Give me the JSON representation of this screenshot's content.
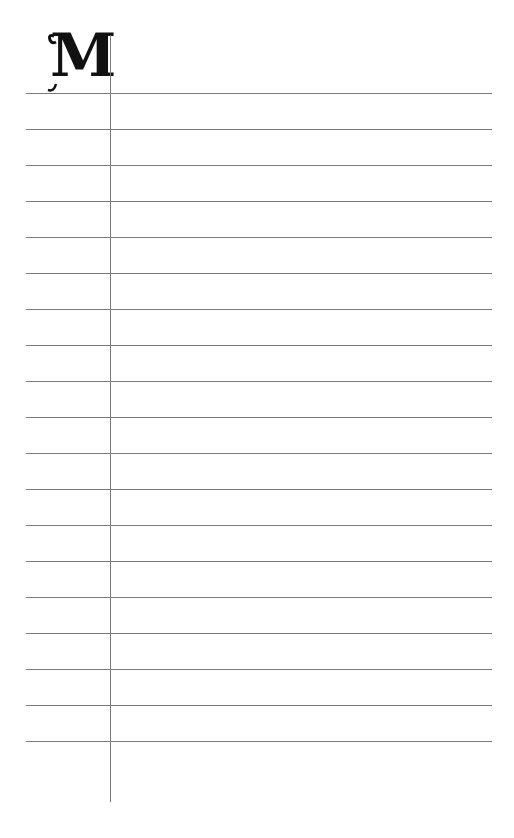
{
  "page": {
    "monogram_letter": "M",
    "line_color": "#7a7a7a",
    "line_count": 19,
    "line_start_y": 93,
    "line_spacing": 36
  }
}
